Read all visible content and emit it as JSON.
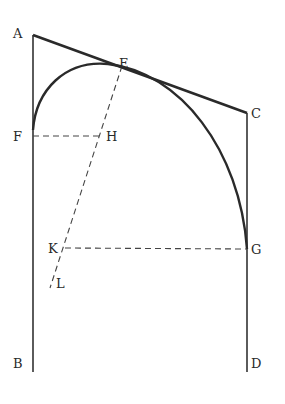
{
  "diagram": {
    "type": "geometric-figure",
    "points": {
      "A": {
        "label": "A",
        "x": 33,
        "y": 35
      },
      "B": {
        "label": "B",
        "x": 33,
        "y": 372
      },
      "C": {
        "label": "C",
        "x": 247,
        "y": 113
      },
      "D": {
        "label": "D",
        "x": 247,
        "y": 372
      },
      "E": {
        "label": "E",
        "x": 113,
        "y": 63
      },
      "F": {
        "label": "F",
        "x": 33,
        "y": 136
      },
      "G": {
        "label": "G",
        "x": 247,
        "y": 249
      },
      "H": {
        "label": "H",
        "x": 100,
        "y": 136
      },
      "K": {
        "label": "K",
        "x": 65,
        "y": 248
      },
      "L": {
        "label": "L",
        "x": 50,
        "y": 287
      }
    },
    "segments": [
      {
        "from": "A",
        "to": "B",
        "style": "solid"
      },
      {
        "from": "C",
        "to": "D",
        "style": "solid"
      },
      {
        "from": "A",
        "to": "C",
        "style": "solid-thick",
        "note": "tangent at E"
      },
      {
        "from": "F",
        "to": "H",
        "style": "dashed"
      },
      {
        "from": "K",
        "to": "G",
        "style": "dashed"
      },
      {
        "from": "E",
        "to": "L",
        "style": "dashed"
      }
    ],
    "curves": [
      {
        "name": "arc-FEG",
        "through": [
          "F",
          "E",
          "G"
        ],
        "style": "solid-thick"
      }
    ]
  }
}
